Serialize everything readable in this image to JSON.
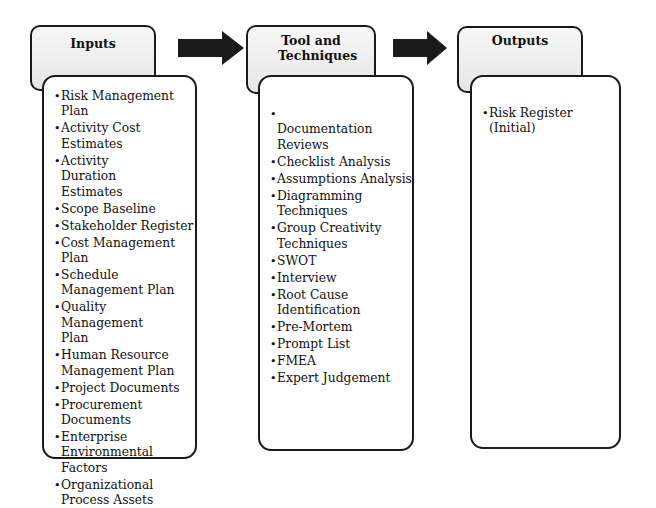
{
  "colors": {
    "stroke": "#1a1a1a",
    "header_fill_top": "#f7f7f7",
    "header_fill_bottom": "#e6e6e6",
    "arrow": "#1a1a1a",
    "background": "#ffffff"
  },
  "columns": [
    {
      "title": "Inputs",
      "items": [
        "Risk Management Plan",
        "Activity Cost Estimates",
        "Activity Duration Estimates",
        "Scope Baseline",
        "Stakeholder Register",
        "Cost Management Plan",
        "Schedule Management Plan",
        "Quality Management Plan",
        "Human Resource Management Plan",
        "Project Documents",
        "Procurement Documents",
        "Enterprise Environmental Factors",
        "Organizational Process Assets"
      ]
    },
    {
      "title": "Tool and Techniques",
      "items": [
        "Documentation Reviews",
        "Checklist Analysis",
        "Assumptions Analysis",
        "Diagramming Techniques",
        "Group Creativity Techniques",
        "SWOT",
        "Interview",
        "Root Cause Identification",
        "Pre-Mortem",
        "Prompt List",
        "FMEA",
        "Expert Judgement"
      ]
    },
    {
      "title": "Outputs",
      "items": [
        "Risk Register (Initial)"
      ]
    }
  ],
  "arrows": [
    {
      "from": "Inputs",
      "to": "Tool and Techniques",
      "icon": "right-arrow-icon"
    },
    {
      "from": "Tool and Techniques",
      "to": "Outputs",
      "icon": "right-arrow-icon"
    }
  ]
}
